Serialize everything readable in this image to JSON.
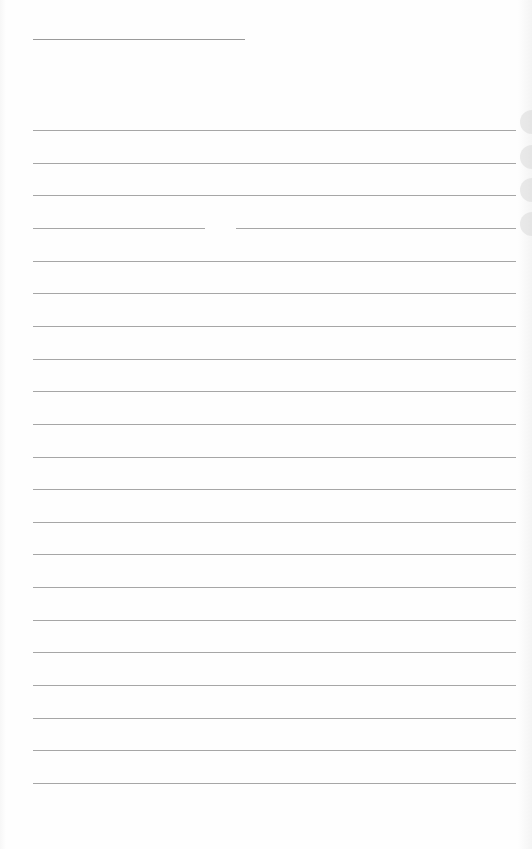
{
  "document": {
    "type": "lined-paper",
    "title_line": {
      "x": 33,
      "y": 39,
      "width": 212
    },
    "rules": {
      "count": 21,
      "first_y": 130,
      "spacing": 32.65,
      "left": 33,
      "width": 483
    },
    "line_gap": {
      "rule_index": 3,
      "x_start": 205,
      "x_end": 236
    },
    "edge_bumps_y": [
      110,
      145,
      178,
      212
    ],
    "colors": {
      "paper": "#fefefe",
      "rule": "#a6a6a6",
      "title_rule": "#9a9a9a"
    }
  }
}
